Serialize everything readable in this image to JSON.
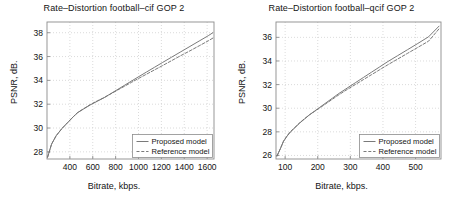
{
  "figure": {
    "background": "#ffffff",
    "axis_color": "#8c8c8c",
    "grid_color": "#cccccc",
    "curve_color": "#737373",
    "text_color": "#141414"
  },
  "panels": [
    {
      "id": "left",
      "ylabel": "PSNR, dB.",
      "xlabel": "Bitrate, kbps."
    },
    {
      "id": "right",
      "ylabel": "PSNR, dB.",
      "xlabel": "Bitrate, kbps."
    }
  ],
  "chart_data": [
    {
      "type": "line",
      "id": "football-cif",
      "title": "Rate–Distortion football–cif GOP 2",
      "xlabel": "Bitrate, kbps.",
      "ylabel": "PSNR, dB.",
      "xlim": [
        200,
        1660
      ],
      "ylim": [
        27.4,
        38.9
      ],
      "xticks": [
        400,
        600,
        800,
        1000,
        1200,
        1400,
        1600
      ],
      "yticks": [
        28,
        30,
        32,
        34,
        36,
        38
      ],
      "xtick_labels": [
        "400",
        "600",
        "800",
        "1000",
        "1200",
        "1400",
        "1600"
      ],
      "ytick_labels": [
        "28",
        "30",
        "32",
        "34",
        "36",
        "38"
      ],
      "grid": true,
      "legend_position": "lower right",
      "series": [
        {
          "name": "Proposed model",
          "style": "solid",
          "x": [
            205,
            240,
            280,
            330,
            380,
            430,
            470,
            520,
            580,
            640,
            700,
            760,
            820,
            880,
            940,
            1000,
            1070,
            1140,
            1210,
            1290,
            1370,
            1450,
            1530,
            1610,
            1650
          ],
          "y": [
            27.55,
            28.65,
            29.35,
            29.95,
            30.45,
            30.95,
            31.3,
            31.6,
            31.95,
            32.25,
            32.55,
            32.9,
            33.25,
            33.6,
            33.95,
            34.3,
            34.7,
            35.1,
            35.5,
            35.95,
            36.4,
            36.85,
            37.3,
            37.75,
            38.0
          ]
        },
        {
          "name": "Reference model",
          "style": "dashed",
          "x": [
            205,
            240,
            280,
            330,
            380,
            430,
            470,
            520,
            580,
            640,
            700,
            760,
            820,
            880,
            940,
            1000,
            1070,
            1140,
            1210,
            1290,
            1370,
            1450,
            1530,
            1610,
            1650
          ],
          "y": [
            27.55,
            28.65,
            29.35,
            29.95,
            30.45,
            30.95,
            31.32,
            31.62,
            31.98,
            32.28,
            32.56,
            32.88,
            33.2,
            33.52,
            33.84,
            34.16,
            34.52,
            34.88,
            35.24,
            35.66,
            36.08,
            36.48,
            36.9,
            37.32,
            37.55
          ]
        }
      ]
    },
    {
      "type": "line",
      "id": "football-qcif",
      "title": "Rate–Distortion football–qcif GOP 2",
      "xlabel": "Bitrate, kbps.",
      "ylabel": "PSNR, dB.",
      "xlim": [
        72,
        578
      ],
      "ylim": [
        25.7,
        37.3
      ],
      "xticks": [
        100,
        200,
        300,
        400,
        500
      ],
      "yticks": [
        26,
        28,
        30,
        32,
        34,
        36
      ],
      "xtick_labels": [
        "100",
        "200",
        "300",
        "400",
        "500"
      ],
      "ytick_labels": [
        "26",
        "28",
        "30",
        "32",
        "34",
        "36"
      ],
      "grid": true,
      "legend_position": "lower right",
      "series": [
        {
          "name": "Proposed model",
          "style": "solid",
          "x": [
            75,
            85,
            95,
            105,
            115,
            130,
            145,
            160,
            175,
            190,
            205,
            225,
            245,
            265,
            290,
            315,
            340,
            365,
            390,
            415,
            445,
            475,
            505,
            540,
            572
          ],
          "y": [
            25.95,
            26.55,
            27.2,
            27.6,
            27.95,
            28.35,
            28.75,
            29.1,
            29.45,
            29.75,
            30.05,
            30.45,
            30.85,
            31.25,
            31.7,
            32.15,
            32.6,
            33.05,
            33.5,
            33.95,
            34.45,
            34.95,
            35.45,
            36.05,
            36.95
          ]
        },
        {
          "name": "Reference model",
          "style": "dashed",
          "x": [
            75,
            85,
            95,
            105,
            115,
            130,
            145,
            160,
            175,
            190,
            205,
            225,
            245,
            265,
            290,
            315,
            340,
            365,
            390,
            415,
            445,
            475,
            505,
            540,
            572
          ],
          "y": [
            25.95,
            26.55,
            27.2,
            27.62,
            27.98,
            28.38,
            28.78,
            29.12,
            29.45,
            29.72,
            30.0,
            30.38,
            30.76,
            31.14,
            31.58,
            32.0,
            32.42,
            32.84,
            33.26,
            33.68,
            34.16,
            34.64,
            35.12,
            35.68,
            36.72
          ]
        }
      ]
    }
  ],
  "legend": {
    "items": [
      {
        "label": "Proposed model",
        "style": "solid"
      },
      {
        "label": "Reference model",
        "style": "dashed"
      }
    ]
  }
}
